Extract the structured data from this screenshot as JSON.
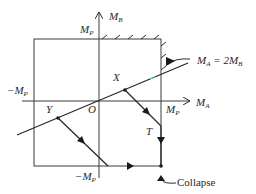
{
  "diagram": {
    "type": "interaction-diagram",
    "axes": {
      "horizontal_label": "M",
      "horizontal_sub": "A",
      "vertical_label": "M",
      "vertical_sub": "B",
      "origin_label": "O"
    },
    "boundary_labels": {
      "top": {
        "text": "M",
        "sub": "P"
      },
      "right": {
        "text": "M",
        "sub": "P"
      },
      "left": {
        "text": "−M",
        "sub": "P"
      },
      "bottom": {
        "text": "−M",
        "sub": "P"
      }
    },
    "load_line": {
      "text": "M",
      "sub": "A",
      "rhs": " = 2M",
      "rhs_sub": "B"
    },
    "points": {
      "X": "X",
      "Y": "Y",
      "T": "T"
    },
    "collapse_label": "Collapse",
    "colors": {
      "line": "#2a2a2a",
      "accent": "#5fd3e0"
    }
  }
}
